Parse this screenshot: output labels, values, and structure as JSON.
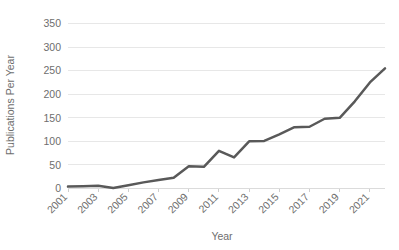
{
  "chart_data": {
    "type": "line",
    "title": "",
    "xlabel": "Year",
    "ylabel": "Publications Per Year",
    "x": [
      2001,
      2002,
      2003,
      2004,
      2005,
      2006,
      2007,
      2008,
      2009,
      2010,
      2011,
      2012,
      2013,
      2014,
      2015,
      2016,
      2017,
      2018,
      2019,
      2020,
      2021,
      2022
    ],
    "values": [
      4,
      5,
      6,
      1,
      7,
      13,
      18,
      23,
      47,
      46,
      80,
      66,
      100,
      101,
      115,
      130,
      131,
      148,
      150,
      185,
      225,
      255
    ],
    "series": [
      {
        "name": "Publications Per Year",
        "values": [
          4,
          5,
          6,
          1,
          7,
          13,
          18,
          23,
          47,
          46,
          80,
          66,
          100,
          101,
          115,
          130,
          131,
          148,
          150,
          185,
          225,
          255
        ]
      }
    ],
    "x_tick_labels": [
      "2001",
      "2003",
      "2005",
      "2007",
      "2009",
      "2011",
      "2013",
      "2015",
      "2017",
      "2019",
      "2021"
    ],
    "y_tick_labels": [
      "0",
      "50",
      "100",
      "150",
      "200",
      "250",
      "300",
      "350"
    ],
    "y_ticks": [
      0,
      50,
      100,
      150,
      200,
      250,
      300,
      350
    ],
    "ylim": [
      0,
      350
    ],
    "xlim": [
      2001,
      2022
    ],
    "grid": true,
    "legend": false,
    "line_color": "#595959",
    "grid_color": "#e4e4e4",
    "text_color": "#6e6e6e",
    "final_value": 310
  }
}
